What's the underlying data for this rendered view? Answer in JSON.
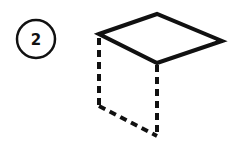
{
  "step": {
    "number": "2",
    "circle": {
      "cx": 36,
      "cy": 39,
      "r": 19
    }
  },
  "figure": {
    "stroke_color": "#111111",
    "top_face": {
      "points": [
        [
          99,
          34
        ],
        [
          157,
          14
        ],
        [
          222,
          41
        ],
        [
          157,
          63
        ]
      ],
      "style": "solid"
    },
    "hidden_edges": [
      {
        "from": [
          99,
          34
        ],
        "to": [
          99,
          106
        ],
        "style": "dashed"
      },
      {
        "from": [
          157,
          63
        ],
        "to": [
          157,
          136
        ],
        "style": "dashed"
      },
      {
        "from": [
          99,
          106
        ],
        "to": [
          157,
          136
        ],
        "style": "dashed"
      }
    ]
  }
}
